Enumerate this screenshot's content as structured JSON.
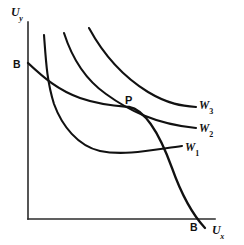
{
  "figure": {
    "background_color": "#ffffff",
    "line_color": "#111111",
    "axis_color": "#2b2b2b",
    "width": 244,
    "height": 245
  },
  "axes": {
    "y_label_main": "U",
    "y_label_sub": "y",
    "x_label_main": "U",
    "x_label_sub": "x",
    "origin_x": 28,
    "origin_y": 219,
    "x_axis_end": 215,
    "y_axis_top": 22
  },
  "labels": {
    "budget_y_intercept": "B",
    "budget_x_intercept": "B",
    "optimum_point": "P",
    "w1_main": "W",
    "w1_sub": "1",
    "w2_main": "W",
    "w2_sub": "2",
    "w3_main": "W",
    "w3_sub": "3"
  },
  "chart_data": {
    "type": "line",
    "xlabel": "Ux",
    "ylabel": "Uy",
    "grid": false,
    "legend": "inline-right",
    "annotations": [
      {
        "text": "B",
        "x": 28,
        "y": 63,
        "note": "utility possibility frontier intercept on Uy axis"
      },
      {
        "text": "B",
        "x": 200,
        "y": 222,
        "note": "utility possibility frontier intercept on Ux axis"
      },
      {
        "text": "P",
        "x": 128,
        "y": 103,
        "note": "social optimum, tangency of BB with W2"
      }
    ],
    "series": [
      {
        "name": "W1",
        "label_main": "W",
        "label_sub": "1",
        "path": "M 44,35 C 46,62 47,82 54,104 C 62,126 78,146 100,151 C 124,156 152,150 182,146",
        "label_x": 185,
        "label_y": 142,
        "note": "lowest social welfare indifference curve"
      },
      {
        "name": "W2",
        "label_main": "W",
        "label_sub": "2",
        "path": "M 64,33 C 72,58 86,80 106,94 C 128,110 155,124 196,128",
        "label_x": 199,
        "label_y": 123,
        "note": "middle social welfare indifference curve, tangent to BB at P"
      },
      {
        "name": "W3",
        "label_main": "W",
        "label_sub": "3",
        "path": "M 89,28 C 102,52 122,76 148,92 C 168,104 182,106 196,107",
        "label_x": 199,
        "label_y": 100,
        "note": "highest social welfare indifference curve"
      },
      {
        "name": "BB",
        "label_main": "B",
        "label_sub": "",
        "path": "M 28,63 C 44,78 58,90 80,98 C 100,105 116,106 129,107 C 146,110 160,135 172,168 C 182,196 192,214 205,228",
        "note": "utility possibility frontier from B on Uy axis to B on Ux axis"
      }
    ]
  }
}
